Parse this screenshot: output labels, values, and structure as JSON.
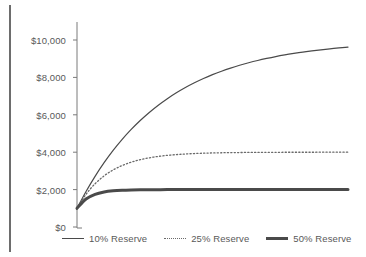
{
  "chart_data": {
    "type": "line",
    "title": "",
    "subtitle": "",
    "xlabel": "",
    "ylabel": "",
    "grid": false,
    "legend_position": "bottom",
    "ylim": [
      0,
      11000
    ],
    "xlim": [
      0,
      30
    ],
    "y_ticks": [
      0,
      2000,
      4000,
      6000,
      8000,
      10000
    ],
    "y_tick_labels": [
      "$0",
      "$2,000",
      "$4,000",
      "$6,000",
      "$8,000",
      "$10,000"
    ],
    "x_ticks": [],
    "x_tick_labels": [],
    "x": [
      0,
      1,
      2,
      3,
      4,
      5,
      6,
      7,
      8,
      9,
      10,
      11,
      12,
      13,
      14,
      15,
      16,
      17,
      18,
      19,
      20,
      21,
      22,
      23,
      24,
      25,
      26,
      27,
      28,
      29,
      30
    ],
    "series": [
      {
        "name": "10% Reserve",
        "style": "solid-thin",
        "color": "#4a4a4a",
        "values": [
          1000,
          1900,
          2710,
          3439,
          4095,
          4686,
          5217,
          5695,
          6126,
          6513,
          6862,
          7176,
          7458,
          7712,
          7941,
          8147,
          8332,
          8499,
          8649,
          8784,
          8906,
          9015,
          9114,
          9203,
          9282,
          9354,
          9418,
          9477,
          9529,
          9576,
          9619
        ]
      },
      {
        "name": "25% Reserve",
        "style": "dotted",
        "color": "#6a6a6a",
        "values": [
          1000,
          1750,
          2313,
          2734,
          3051,
          3288,
          3466,
          3600,
          3700,
          3775,
          3831,
          3873,
          3905,
          3929,
          3947,
          3960,
          3970,
          3977,
          3983,
          3987,
          3990,
          3993,
          3995,
          3996,
          3997,
          3998,
          3998,
          3999,
          3999,
          3999,
          4000
        ]
      },
      {
        "name": "50% Reserve",
        "style": "solid-thick",
        "color": "#4a4a4a",
        "values": [
          1000,
          1500,
          1750,
          1875,
          1938,
          1969,
          1984,
          1992,
          1996,
          1998,
          1999,
          2000,
          2000,
          2000,
          2000,
          2000,
          2000,
          2000,
          2000,
          2000,
          2000,
          2000,
          2000,
          2000,
          2000,
          2000,
          2000,
          2000,
          2000,
          2000,
          2000
        ]
      }
    ]
  },
  "axis": {
    "tick_labels": [
      "$10,000",
      "$8,000",
      "$6,000",
      "$4,000",
      "$2,000",
      "$0"
    ]
  },
  "legend": {
    "items": [
      {
        "label": "10% Reserve",
        "style": "solid-thin"
      },
      {
        "label": "25% Reserve",
        "style": "dotted"
      },
      {
        "label": "50% Reserve",
        "style": "solid-thick"
      }
    ]
  },
  "colors": {
    "line_dark": "#4a4a4a",
    "line_mid": "#6a6a6a",
    "axis": "#7a7a7a",
    "text": "#595959",
    "rule": "#6d6d6d",
    "background": "#ffffff"
  }
}
